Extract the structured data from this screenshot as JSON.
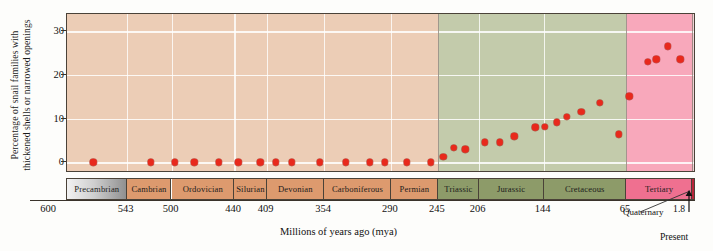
{
  "chart_data": {
    "type": "scatter",
    "title": "",
    "xlabel": "Millions of years ago (mya)",
    "ylabel": "Percentage of snail families with thickened shells or narrowed openings",
    "ylabel_line1": "Percentage of snail families with",
    "ylabel_line2": "thickened shells or narrowed openings",
    "xlim": [
      600,
      0
    ],
    "ylim": [
      -2,
      34
    ],
    "yticks": [
      0,
      10,
      20,
      30
    ],
    "ytick_labels": [
      "0",
      "10",
      "20",
      "30"
    ],
    "xticks": [
      600,
      543,
      500,
      440,
      409,
      354,
      290,
      245,
      206,
      144,
      65,
      1.8
    ],
    "xtick_labels": [
      "600",
      "543",
      "500",
      "440",
      "409",
      "354",
      "290",
      "245",
      "206",
      "144",
      "65",
      "1.8"
    ],
    "x_axis_reversed": true,
    "grid": "horizontal and vertical white gridlines at period boundaries",
    "legend": "none",
    "point_color": "#e8291c",
    "points": [
      {
        "x": 575,
        "y": 0
      },
      {
        "x": 520,
        "y": 0
      },
      {
        "x": 497,
        "y": 0
      },
      {
        "x": 478,
        "y": 0
      },
      {
        "x": 455,
        "y": 0
      },
      {
        "x": 436,
        "y": 0
      },
      {
        "x": 415,
        "y": 0
      },
      {
        "x": 400,
        "y": 0
      },
      {
        "x": 385,
        "y": 0
      },
      {
        "x": 358,
        "y": 0
      },
      {
        "x": 333,
        "y": 0
      },
      {
        "x": 310,
        "y": 0
      },
      {
        "x": 296,
        "y": 0
      },
      {
        "x": 275,
        "y": 0
      },
      {
        "x": 252,
        "y": 0
      },
      {
        "x": 240,
        "y": 1.3
      },
      {
        "x": 230,
        "y": 3.3
      },
      {
        "x": 219,
        "y": 3.0
      },
      {
        "x": 200,
        "y": 4.6
      },
      {
        "x": 186,
        "y": 4.6
      },
      {
        "x": 172,
        "y": 6.0
      },
      {
        "x": 152,
        "y": 8.0
      },
      {
        "x": 143,
        "y": 8.2
      },
      {
        "x": 131,
        "y": 9.2
      },
      {
        "x": 122,
        "y": 10.4
      },
      {
        "x": 108,
        "y": 11.6
      },
      {
        "x": 90,
        "y": 13.7
      },
      {
        "x": 72,
        "y": 6.4
      },
      {
        "x": 62,
        "y": 15.1
      },
      {
        "x": 44,
        "y": 23.0
      },
      {
        "x": 36,
        "y": 23.6
      },
      {
        "x": 25,
        "y": 26.6
      },
      {
        "x": 13,
        "y": 23.6
      }
    ],
    "periods": [
      {
        "name": "Precambrian",
        "start": 600,
        "end": 543,
        "color": "#9c9c9c",
        "gradient": true
      },
      {
        "name": "Cambrian",
        "start": 543,
        "end": 500,
        "color": "#dd9a6e"
      },
      {
        "name": "Ordovician",
        "start": 500,
        "end": 440,
        "color": "#dd9a6e"
      },
      {
        "name": "Silurian",
        "start": 440,
        "end": 409,
        "color": "#dd9a6e"
      },
      {
        "name": "Devonian",
        "start": 409,
        "end": 354,
        "color": "#dd9a6e"
      },
      {
        "name": "Carboniferous",
        "start": 354,
        "end": 290,
        "color": "#dd9a6e"
      },
      {
        "name": "Permian",
        "start": 290,
        "end": 245,
        "color": "#dd9a6e"
      },
      {
        "name": "Triassic",
        "start": 245,
        "end": 206,
        "color": "#8d9b69"
      },
      {
        "name": "Jurassic",
        "start": 206,
        "end": 144,
        "color": "#8d9b69"
      },
      {
        "name": "Cretaceous",
        "start": 144,
        "end": 65,
        "color": "#8d9b69"
      },
      {
        "name": "Tertiary",
        "start": 65,
        "end": 1.8,
        "color": "#ef7090"
      },
      {
        "name": "Quaternary",
        "start": 1.8,
        "end": 0,
        "color": "#b9253a"
      }
    ],
    "plot_bands": [
      {
        "from": 600,
        "to": 543,
        "color": "#eccdb6"
      },
      {
        "from": 543,
        "to": 245,
        "color": "#eccdb6"
      },
      {
        "from": 245,
        "to": 65,
        "color": "#c3cbab"
      },
      {
        "from": 65,
        "to": 1.8,
        "color": "#f8a8bb"
      },
      {
        "from": 1.8,
        "to": 0,
        "color": "#b9253a"
      }
    ],
    "annotations": {
      "quaternary": "Quaternary",
      "present": "Present"
    }
  }
}
